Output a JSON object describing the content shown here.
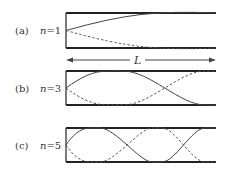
{
  "figure": {
    "length_label": "L",
    "panels": [
      {
        "id": "a",
        "label": "(a)",
        "n_prefix": "n",
        "n_value": "=1",
        "harmonic": 1
      },
      {
        "id": "b",
        "label": "(b)",
        "n_prefix": "n",
        "n_value": "=3",
        "harmonic": 3
      },
      {
        "id": "c",
        "label": "(c)",
        "n_prefix": "n",
        "n_value": "=5",
        "harmonic": 5
      }
    ]
  },
  "colors": {
    "line": "#444444",
    "frame": "#222222",
    "background": "#ffffff"
  }
}
